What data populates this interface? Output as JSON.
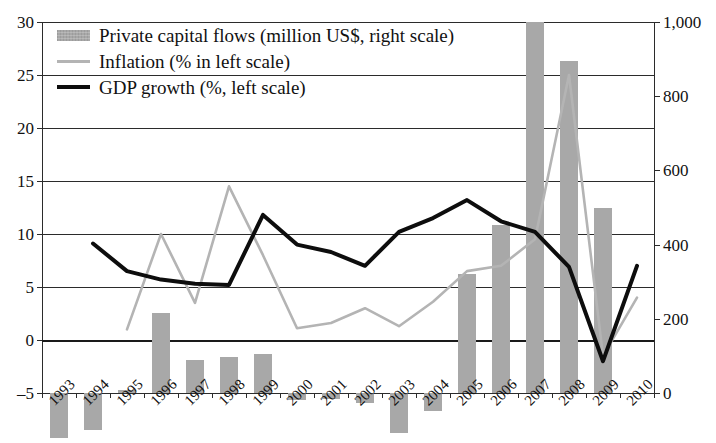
{
  "chart_data": {
    "type": "bar",
    "title": "",
    "subtitle": "",
    "xlabel": "",
    "ylabel": "",
    "grid": true,
    "legend_position": "top-left",
    "categories": [
      "1993",
      "1994",
      "1995",
      "1996",
      "1997",
      "1998",
      "1999",
      "2000",
      "2001",
      "2002",
      "2003",
      "2004",
      "2005",
      "2006",
      "2007",
      "2008",
      "2009",
      "2010"
    ],
    "left_axis": {
      "label": "%",
      "ticks": [
        "30",
        "25",
        "20",
        "15",
        "10",
        "5",
        "0",
        "-5"
      ],
      "tick_values": [
        30,
        25,
        20,
        15,
        10,
        5,
        0,
        -5
      ],
      "ylim": [
        -5,
        30
      ]
    },
    "right_axis": {
      "label": "million US$",
      "ticks": [
        "1,000",
        "800",
        "600",
        "400",
        "200",
        "0"
      ],
      "tick_values": [
        1000,
        800,
        600,
        400,
        200,
        0
      ],
      "ylim": [
        0,
        1000
      ]
    },
    "series": [
      {
        "name": "Private capital flows (million US$, right scale)",
        "kind": "bar",
        "axis": "right",
        "color": "#a8a8a8",
        "values": [
          -120,
          -100,
          8,
          216,
          88,
          96,
          104,
          -20,
          -16,
          -28,
          -108,
          -48,
          320,
          452,
          1000,
          896,
          500,
          null
        ]
      },
      {
        "name": "Inflation (% in left scale)",
        "kind": "line",
        "axis": "left",
        "color": "#b4b4b4",
        "values": [
          null,
          null,
          1.0,
          10.0,
          3.5,
          14.5,
          8.0,
          1.1,
          1.6,
          3.0,
          1.3,
          3.6,
          6.5,
          7.0,
          9.5,
          25.0,
          -1.5,
          4.0
        ]
      },
      {
        "name": "GDP growth (%, left scale)",
        "kind": "line",
        "axis": "left",
        "color": "#0d0d0d",
        "values": [
          null,
          9.1,
          6.5,
          5.7,
          5.3,
          5.2,
          11.8,
          9.0,
          8.3,
          7.0,
          10.2,
          11.5,
          13.2,
          11.2,
          10.2,
          6.9,
          -2.0,
          7.0
        ]
      }
    ]
  },
  "legend": {
    "items": [
      {
        "label": "Private capital flows (million US$, right scale)",
        "swatch": "bars"
      },
      {
        "label": "Inflation (% in left scale)",
        "swatch": "lineA"
      },
      {
        "label": "GDP growth (%, left scale)",
        "swatch": "lineB"
      }
    ]
  }
}
